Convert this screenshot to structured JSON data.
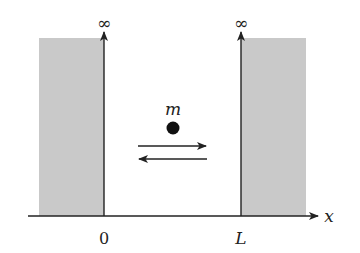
{
  "diagram": {
    "colors": {
      "wall_fill": "#c9c9c9",
      "line": "#222222",
      "particle": "#111111",
      "text": "#222222"
    },
    "labels": {
      "left_wall_height": "∞",
      "right_wall_height": "∞",
      "particle_mass": "m",
      "origin": "0",
      "width": "L",
      "axis": "x"
    }
  }
}
